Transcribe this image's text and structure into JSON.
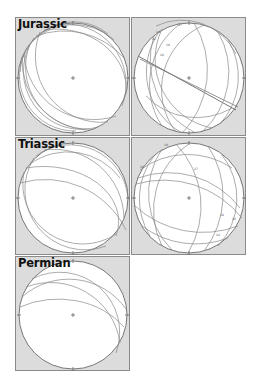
{
  "figure": {
    "panels": [
      {
        "id": "jurassic-poles",
        "title": "Jurassic",
        "type": "stereonet-great-circles"
      },
      {
        "id": "jurassic-lineations",
        "title": "",
        "type": "stereonet-great-circles-with-labels"
      },
      {
        "id": "triassic-poles",
        "title": "Triassic",
        "type": "stereonet-great-circles"
      },
      {
        "id": "triassic-lineations",
        "title": "",
        "type": "stereonet-great-circles-with-labels"
      },
      {
        "id": "permian-poles",
        "title": "Permian",
        "type": "stereonet-great-circles"
      }
    ],
    "colors": {
      "panel_background": "#dcdcdc",
      "net_fill": "#ffffff",
      "line_color": "#7a7a7a",
      "border": "#8a8a8a"
    }
  }
}
